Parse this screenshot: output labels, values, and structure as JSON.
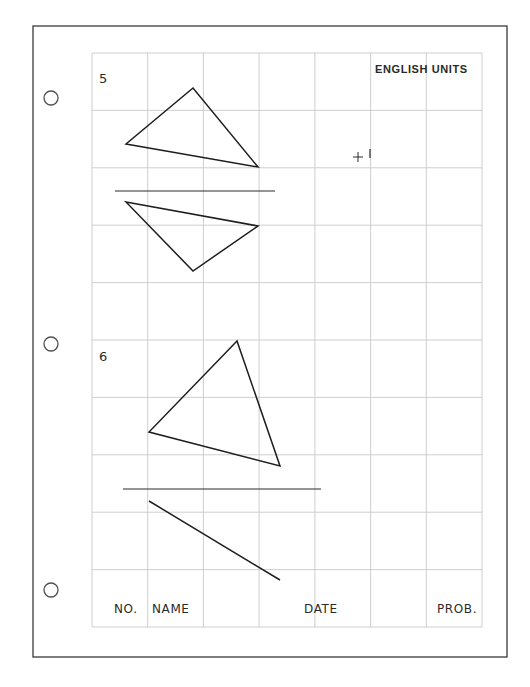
{
  "sheet": {
    "units_label": "ENGLISH UNITS",
    "colors": {
      "paper": "#ffffff",
      "border": "#3a3a3a",
      "grid": "#c8c8c8",
      "ink": "#1e1e1e",
      "hole": "#505050"
    },
    "border": {
      "x": 33,
      "y": 26,
      "width": 474,
      "height": 631
    },
    "grid": {
      "x": 92,
      "y": 53,
      "width": 390,
      "height": 574,
      "columns": 7,
      "rows": 10
    },
    "binder_holes": [
      {
        "cx": 51,
        "cy": 98,
        "r": 7
      },
      {
        "cx": 51,
        "cy": 344,
        "r": 7
      },
      {
        "cx": 51,
        "cy": 590,
        "r": 7
      }
    ]
  },
  "problems": [
    {
      "number": "5",
      "label_pos": {
        "x": 99,
        "y": 72
      },
      "top_view_triangle": [
        [
          193,
          88
        ],
        [
          126,
          144
        ],
        [
          258,
          167
        ]
      ],
      "folding_line": {
        "x1": 115,
        "y1": 191,
        "x2": 275,
        "y2": 191
      },
      "front_view_triangle": [
        [
          126,
          202
        ],
        [
          258,
          226
        ],
        [
          193,
          271
        ]
      ]
    },
    {
      "number": "6",
      "label_pos": {
        "x": 99,
        "y": 350
      },
      "top_view_triangle": [
        [
          237,
          341
        ],
        [
          149,
          432
        ],
        [
          280,
          466
        ]
      ],
      "folding_line": {
        "x1": 123,
        "y1": 489,
        "x2": 321,
        "y2": 489
      },
      "front_view_edge": {
        "x1": 149,
        "y1": 501,
        "x2": 280,
        "y2": 580
      }
    }
  ],
  "marker": {
    "icon": "crosshair-icon",
    "cx": 358,
    "cy": 157,
    "size": 5,
    "tick": {
      "x": 370,
      "y1": 149,
      "y2": 158
    }
  },
  "title_block": {
    "fields": [
      {
        "label": "NO.",
        "x": 114
      },
      {
        "label": "NAME",
        "x": 152
      },
      {
        "label": "DATE",
        "x": 304
      },
      {
        "label": "PROB.",
        "x": 437
      }
    ],
    "baseline_y": 602
  }
}
